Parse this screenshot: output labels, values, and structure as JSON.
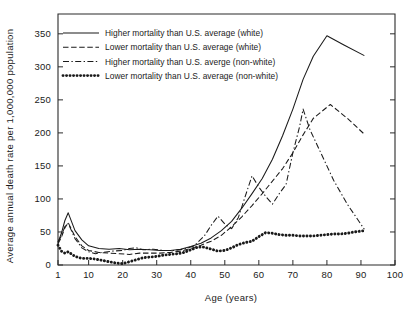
{
  "chart_data": {
    "type": "line",
    "title": "",
    "xlabel": "Age  (years)",
    "ylabel": "Average annual death rate per 1,000,000 population",
    "xlim": [
      1,
      100
    ],
    "ylim": [
      0,
      380
    ],
    "xticks": [
      1,
      10,
      20,
      30,
      40,
      50,
      60,
      70,
      80,
      90,
      100
    ],
    "xticklabels": [
      "1",
      "10",
      "20",
      "30",
      "40",
      "50",
      "60",
      "70",
      "80",
      "90",
      "100"
    ],
    "yticks": [
      0,
      50,
      100,
      150,
      200,
      250,
      300,
      350
    ],
    "yticklabels": [
      "0",
      "50",
      "100",
      "150",
      "200",
      "250",
      "300",
      "350"
    ],
    "grid": false,
    "legend_position": "upper-left",
    "series": [
      {
        "name": "Higher mortality than U.S. average (white)",
        "style": "solid",
        "points": [
          [
            1,
            34
          ],
          [
            2,
            48
          ],
          [
            3,
            67
          ],
          [
            4,
            79
          ],
          [
            6,
            52
          ],
          [
            8,
            38
          ],
          [
            10,
            29
          ],
          [
            13,
            25
          ],
          [
            16,
            24
          ],
          [
            19,
            25
          ],
          [
            22,
            23
          ],
          [
            25,
            24
          ],
          [
            28,
            23
          ],
          [
            31,
            22
          ],
          [
            34,
            22
          ],
          [
            37,
            24
          ],
          [
            40,
            28
          ],
          [
            43,
            33
          ],
          [
            46,
            41
          ],
          [
            49,
            52
          ],
          [
            52,
            66
          ],
          [
            55,
            86
          ],
          [
            58,
            108
          ],
          [
            61,
            131
          ],
          [
            64,
            160
          ],
          [
            67,
            196
          ],
          [
            70,
            236
          ],
          [
            73,
            281
          ],
          [
            76,
            316
          ],
          [
            80,
            347
          ],
          [
            85,
            333
          ],
          [
            91,
            317
          ]
        ]
      },
      {
        "name": "Lower mortality than U.S. average (white)",
        "style": "dashed",
        "points": [
          [
            1,
            32
          ],
          [
            2,
            42
          ],
          [
            3,
            56
          ],
          [
            4,
            64
          ],
          [
            6,
            43
          ],
          [
            8,
            29
          ],
          [
            10,
            22
          ],
          [
            13,
            19
          ],
          [
            16,
            18
          ],
          [
            19,
            17
          ],
          [
            22,
            16
          ],
          [
            25,
            18
          ],
          [
            28,
            18
          ],
          [
            31,
            18
          ],
          [
            34,
            19
          ],
          [
            37,
            21
          ],
          [
            40,
            25
          ],
          [
            43,
            30
          ],
          [
            46,
            36
          ],
          [
            49,
            45
          ],
          [
            52,
            58
          ],
          [
            55,
            73
          ],
          [
            58,
            90
          ],
          [
            61,
            108
          ],
          [
            64,
            127
          ],
          [
            67,
            146
          ],
          [
            70,
            170
          ],
          [
            73,
            197
          ],
          [
            76,
            222
          ],
          [
            81,
            243
          ],
          [
            86,
            222
          ],
          [
            91,
            198
          ]
        ]
      },
      {
        "name": "Higher mortality than U.S. averge (non-white)",
        "style": "dashdot",
        "points": [
          [
            1,
            35
          ],
          [
            2,
            44
          ],
          [
            3,
            58
          ],
          [
            4,
            63
          ],
          [
            6,
            40
          ],
          [
            8,
            26
          ],
          [
            10,
            20
          ],
          [
            12,
            17
          ],
          [
            14,
            19
          ],
          [
            17,
            21
          ],
          [
            20,
            22
          ],
          [
            22,
            25
          ],
          [
            24,
            26
          ],
          [
            26,
            23
          ],
          [
            29,
            24
          ],
          [
            32,
            22
          ],
          [
            35,
            22
          ],
          [
            38,
            24
          ],
          [
            41,
            29
          ],
          [
            44,
            44
          ],
          [
            46,
            60
          ],
          [
            48,
            74
          ],
          [
            50,
            62
          ],
          [
            52,
            55
          ],
          [
            54,
            72
          ],
          [
            56,
            104
          ],
          [
            58,
            135
          ],
          [
            60,
            118
          ],
          [
            62,
            104
          ],
          [
            64,
            92
          ],
          [
            66,
            108
          ],
          [
            68,
            122
          ],
          [
            70,
            170
          ],
          [
            72,
            210
          ],
          [
            73,
            236
          ],
          [
            75,
            205
          ],
          [
            78,
            172
          ],
          [
            82,
            128
          ],
          [
            86,
            92
          ],
          [
            91,
            54
          ]
        ]
      },
      {
        "name": "Lower mortality than U.S. average (non-white)",
        "style": "dotted",
        "points": [
          [
            1,
            30
          ],
          [
            2,
            21
          ],
          [
            3,
            18
          ],
          [
            4,
            20
          ],
          [
            6,
            13
          ],
          [
            8,
            10
          ],
          [
            10,
            10
          ],
          [
            12,
            9
          ],
          [
            14,
            7
          ],
          [
            16,
            5
          ],
          [
            18,
            3
          ],
          [
            20,
            2
          ],
          [
            22,
            5
          ],
          [
            24,
            8
          ],
          [
            26,
            11
          ],
          [
            28,
            12
          ],
          [
            30,
            13
          ],
          [
            32,
            15
          ],
          [
            34,
            16
          ],
          [
            36,
            17
          ],
          [
            38,
            19
          ],
          [
            40,
            23
          ],
          [
            42,
            27
          ],
          [
            44,
            27
          ],
          [
            46,
            24
          ],
          [
            48,
            21
          ],
          [
            50,
            22
          ],
          [
            52,
            26
          ],
          [
            54,
            31
          ],
          [
            56,
            34
          ],
          [
            58,
            36
          ],
          [
            60,
            43
          ],
          [
            62,
            49
          ],
          [
            64,
            48
          ],
          [
            66,
            46
          ],
          [
            68,
            45
          ],
          [
            70,
            45
          ],
          [
            72,
            44
          ],
          [
            74,
            44
          ],
          [
            76,
            44
          ],
          [
            78,
            45
          ],
          [
            80,
            46
          ],
          [
            82,
            47
          ],
          [
            84,
            47
          ],
          [
            86,
            48
          ],
          [
            88,
            50
          ],
          [
            91,
            52
          ]
        ]
      }
    ]
  },
  "legend": {
    "entries": [
      {
        "label": "Higher mortality than U.S. average (white)",
        "style": "solid"
      },
      {
        "label": "Lower mortality than U.S. average (white)",
        "style": "dashed"
      },
      {
        "label": "Higher mortality than U.S. averge (non-white)",
        "style": "dashdot"
      },
      {
        "label": "Lower mortality than U.S. average (non-white)",
        "style": "dotted"
      }
    ]
  },
  "colors": {
    "ink": "#1a1a1a",
    "axis": "#2b2b2b",
    "background": "#ffffff"
  }
}
